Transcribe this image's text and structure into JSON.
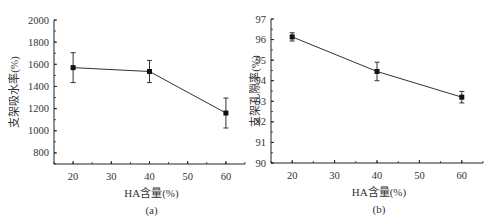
{
  "chart_data": [
    {
      "type": "line",
      "panel_label": "(a)",
      "title": "",
      "xlabel": "HA含量(%)",
      "ylabel": "支架吸水率(%)",
      "x": [
        20,
        40,
        60
      ],
      "series": [
        {
          "name": "支架吸水率",
          "values": [
            1570,
            1535,
            1160
          ],
          "error": [
            135,
            100,
            135
          ]
        }
      ],
      "xlim": [
        15,
        65
      ],
      "ylim": [
        700,
        2000
      ],
      "xticks": [
        20,
        30,
        40,
        50,
        60
      ],
      "yticks": [
        800,
        1000,
        1200,
        1400,
        1600,
        1800,
        2000
      ],
      "grid": false,
      "legend": "none",
      "marker": "square",
      "color": "#111111"
    },
    {
      "type": "line",
      "panel_label": "(b)",
      "title": "",
      "xlabel": "HA含量(%)",
      "ylabel": "支架孔隙率(%)",
      "x": [
        20,
        40,
        60
      ],
      "series": [
        {
          "name": "支架孔隙率",
          "values": [
            96.13,
            94.45,
            93.2
          ],
          "error": [
            0.2,
            0.45,
            0.28
          ]
        }
      ],
      "xlim": [
        15,
        65
      ],
      "ylim": [
        90,
        97
      ],
      "xticks": [
        20,
        30,
        40,
        50,
        60
      ],
      "yticks": [
        90,
        91,
        92,
        93,
        94,
        95,
        96,
        97
      ],
      "grid": false,
      "legend": "none",
      "marker": "square",
      "color": "#111111"
    }
  ],
  "panels": {
    "a": {
      "label": "(a)",
      "xlabel": "HA含量(%)",
      "ylabel": "支架吸水率(%)"
    },
    "b": {
      "label": "(b)",
      "xlabel": "HA含量(%)",
      "ylabel": "支架孔隙率(%)"
    }
  }
}
